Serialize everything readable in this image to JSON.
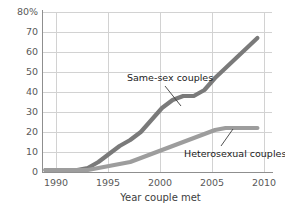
{
  "chart_data": {
    "type": "line",
    "title": "",
    "subtitle": "",
    "xlabel": "Year couple met",
    "ylabel": "",
    "xlim": [
      1988.5,
      2010.8
    ],
    "ylim": [
      0,
      80
    ],
    "grid": true,
    "legend_position": "inline-annotation",
    "x_ticks": [
      "1990",
      "1995",
      "2000",
      "2005",
      "2010"
    ],
    "x_tick_values": [
      1990,
      1995,
      2000,
      2005,
      2010
    ],
    "y_ticks": [
      "0",
      "10",
      "20",
      "30",
      "40",
      "50",
      "60",
      "70",
      "80%"
    ],
    "y_tick_values": [
      0,
      10,
      20,
      30,
      40,
      50,
      60,
      70,
      80
    ],
    "series": [
      {
        "name": "Same-sex couples",
        "color": "#7a7a7a",
        "x": [
          1989,
          1990,
          1991,
          1992,
          1993,
          1994,
          1995,
          1996,
          1997,
          1998,
          1999,
          2000,
          2001,
          2002,
          2003,
          2004,
          2005,
          2006,
          2007,
          2008,
          2009
        ],
        "values": [
          1,
          1,
          1,
          1,
          2,
          5,
          9,
          13,
          16,
          20,
          26,
          32,
          36,
          38,
          38,
          41,
          47,
          52,
          57,
          62,
          67
        ]
      },
      {
        "name": "Heterosexual couples",
        "color": "#9d9d9d",
        "x": [
          1989,
          1990,
          1991,
          1992,
          1993,
          1994,
          1995,
          1996,
          1997,
          1998,
          1999,
          2000,
          2001,
          2002,
          2003,
          2004,
          2005,
          2006,
          2007,
          2008,
          2009
        ],
        "values": [
          1,
          1,
          1,
          1,
          1,
          2,
          3,
          4,
          5,
          7,
          9,
          11,
          13,
          15,
          17,
          19,
          21,
          22,
          22,
          22,
          22
        ]
      }
    ],
    "annotations": [
      {
        "text": "Same-sex couples",
        "series": "Same-sex couples"
      },
      {
        "text": "Heterosexual couples",
        "series": "Heterosexual couples"
      }
    ]
  }
}
